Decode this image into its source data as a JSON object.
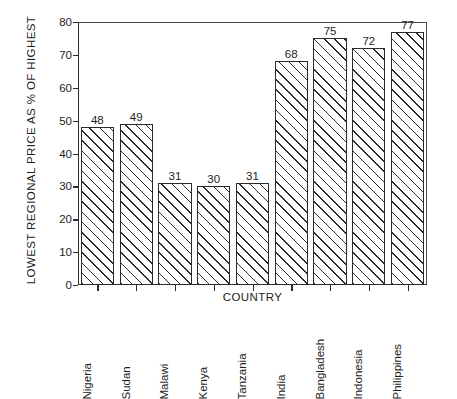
{
  "chart_data": {
    "type": "bar",
    "title": "",
    "subtitle": "",
    "xlabel": "COUNTRY",
    "ylabel": "LOWEST REGIONAL PRICE AS % OF HIGHEST",
    "categories": [
      "Nigeria",
      "Sudan",
      "Malawi",
      "Kenya",
      "Tanzania",
      "India",
      "Bangladesh",
      "Indonesia",
      "Philippines"
    ],
    "values": [
      48,
      49,
      31,
      30,
      31,
      68,
      75,
      72,
      77
    ],
    "value_labels": [
      "48",
      "49",
      "31",
      "30",
      "31",
      "68",
      "75",
      "72",
      "77"
    ],
    "ylim": [
      0,
      80
    ],
    "ytick_values": [
      0,
      10,
      20,
      30,
      40,
      50,
      60,
      70,
      80
    ],
    "ytick_labels": [
      "0",
      "10",
      "20",
      "30",
      "40",
      "50",
      "60",
      "70",
      "80"
    ],
    "grid": false,
    "legend": null,
    "bar_style": "white fill with diagonal hatch, black outline",
    "colors": {
      "bar_fill": "#ffffff",
      "bar_edge": "#2a2a2a",
      "hatch": "#2a2a2a",
      "axis": "#2c2c2c",
      "text": "#1d1d1d",
      "background": "#ffffff"
    }
  }
}
